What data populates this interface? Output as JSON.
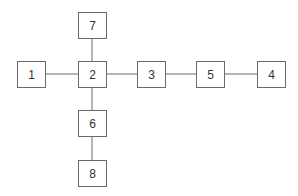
{
  "diagram": {
    "type": "tree",
    "nodes": [
      {
        "id": "1",
        "label": "1",
        "x": 17,
        "y": 61,
        "w": 28,
        "h": 26
      },
      {
        "id": "2",
        "label": "2",
        "x": 78,
        "y": 61,
        "w": 28,
        "h": 26
      },
      {
        "id": "7",
        "label": "7",
        "x": 78,
        "y": 12,
        "w": 28,
        "h": 26
      },
      {
        "id": "3",
        "label": "3",
        "x": 137,
        "y": 61,
        "w": 28,
        "h": 26
      },
      {
        "id": "5",
        "label": "5",
        "x": 196,
        "y": 61,
        "w": 28,
        "h": 26
      },
      {
        "id": "4",
        "label": "4",
        "x": 257,
        "y": 61,
        "w": 28,
        "h": 26
      },
      {
        "id": "6",
        "label": "6",
        "x": 78,
        "y": 110,
        "w": 28,
        "h": 26
      },
      {
        "id": "8",
        "label": "8",
        "x": 78,
        "y": 160,
        "w": 28,
        "h": 26
      }
    ],
    "edges": [
      {
        "from": "1",
        "to": "2"
      },
      {
        "from": "2",
        "to": "7"
      },
      {
        "from": "2",
        "to": "3"
      },
      {
        "from": "3",
        "to": "5"
      },
      {
        "from": "5",
        "to": "4"
      },
      {
        "from": "2",
        "to": "6"
      },
      {
        "from": "6",
        "to": "8"
      }
    ]
  }
}
